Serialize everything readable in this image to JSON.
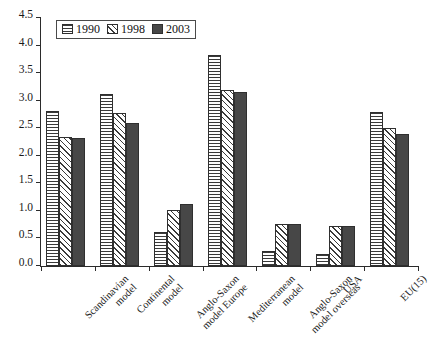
{
  "chart_data": {
    "type": "bar",
    "title": "",
    "xlabel": "",
    "ylabel": "",
    "ylim": [
      0.0,
      4.5
    ],
    "ytick_labels": [
      "4.5",
      "4.0",
      "3.5",
      "3.0",
      "2.5",
      "2.0",
      "1.5",
      "1.0",
      "0.5",
      "0.0"
    ],
    "ytick_values": [
      4.5,
      4.0,
      3.5,
      3.0,
      2.5,
      2.0,
      1.5,
      1.0,
      0.5,
      0.0
    ],
    "grid": false,
    "legend_position": "top-left",
    "categories": [
      "Scandinavian model",
      "Continental model",
      "Anglo-Saxon model Europe",
      "Mediterranean model",
      "Anglo-Saxon model overseas",
      "USA",
      "EU(15)"
    ],
    "category_lines": [
      [
        "Scandinavian",
        "model"
      ],
      [
        "Continental",
        "model"
      ],
      [
        "Anglo-Saxon",
        "model Europe"
      ],
      [
        "Mediterranean",
        "model"
      ],
      [
        "Anglo-Saxon",
        "model overseas"
      ],
      [
        "USA"
      ],
      [
        "EU(15)"
      ]
    ],
    "series": [
      {
        "name": "1990",
        "pattern": "horizontal-lines",
        "values": [
          2.82,
          3.12,
          0.62,
          3.82,
          0.28,
          0.22,
          2.79
        ]
      },
      {
        "name": "1998",
        "pattern": "diagonal-hatch",
        "values": [
          2.35,
          2.77,
          1.02,
          3.19,
          0.77,
          0.72,
          2.51
        ]
      },
      {
        "name": "2003",
        "pattern": "solid-dark",
        "values": [
          2.32,
          2.59,
          1.12,
          3.15,
          0.77,
          0.72,
          2.4
        ]
      }
    ]
  },
  "legend": {
    "entries": [
      {
        "label": "1990"
      },
      {
        "label": "1998"
      },
      {
        "label": "2003"
      }
    ]
  }
}
